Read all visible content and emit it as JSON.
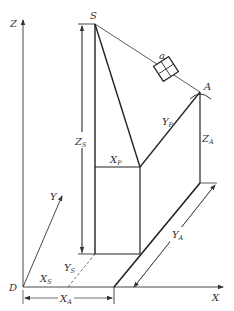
{
  "diagram": {
    "type": "3d-coordinate-geometry",
    "colors": {
      "line": "#333333",
      "background": "#ffffff"
    },
    "axes": {
      "x": {
        "label": "X"
      },
      "y": {
        "label": "Y"
      },
      "z": {
        "label": "Z"
      },
      "origin": {
        "label": "D"
      }
    },
    "points": {
      "source": {
        "label": "S"
      },
      "target": {
        "label": "A"
      },
      "detector": {
        "label": "a"
      }
    },
    "dimensions": {
      "zs": {
        "main": "Z",
        "sub": "S"
      },
      "za": {
        "main": "Z",
        "sub": "A"
      },
      "xp": {
        "main": "X",
        "sub": "P"
      },
      "yp": {
        "main": "Y",
        "sub": "P"
      },
      "xs": {
        "main": "X",
        "sub": "S"
      },
      "ys": {
        "main": "Y",
        "sub": "S"
      },
      "xa": {
        "main": "X",
        "sub": "A"
      },
      "ya": {
        "main": "Y",
        "sub": "A"
      }
    }
  }
}
